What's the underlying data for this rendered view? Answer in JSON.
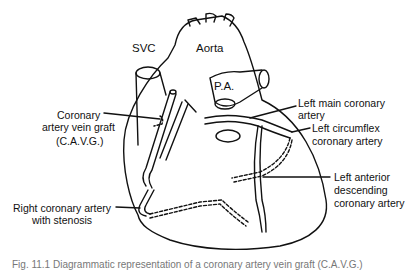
{
  "diagram": {
    "labels": {
      "svc": "SVC",
      "aorta": "Aorta",
      "pa": "P.A.",
      "cavg_line1": "Coronary",
      "cavg_line2": "artery vein graft",
      "cavg_line3": "(C.A.V.G.)",
      "lmca_line1": "Left main coronary",
      "lmca_line2": "artery",
      "lcx_line1": "Left circumflex",
      "lcx_line2": "coronary artery",
      "lad_line1": "Left anterior",
      "lad_line2": "descending",
      "lad_line3": "coronary artery",
      "rca_line1": "Right coronary artery",
      "rca_line2": "with stenosis"
    },
    "caption": "Fig. 11.1  Diagrammatic representation of a coronary artery vein graft (C.A.V.G.)"
  }
}
